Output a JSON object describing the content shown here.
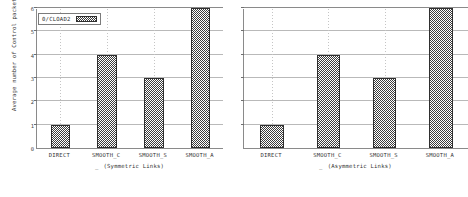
{
  "chart_data": {
    "type": "bar",
    "title": "",
    "xlabel": "",
    "ylabel": "Average number of Control packets per Handover [n]",
    "ylim": [
      0,
      6
    ],
    "yticks": [
      0,
      1,
      2,
      3,
      4,
      5,
      6
    ],
    "grid": true,
    "legend": {
      "position": "top-left",
      "entries": [
        {
          "label": "0/CLOAD2",
          "swatch": "hatched-dark-gray"
        }
      ]
    },
    "panels": [
      {
        "name": "symmetric",
        "subtitle": "(Symmetric Links)",
        "subtitle_prefix": "_",
        "categories": [
          "DIRECT",
          "SMOOTH_C",
          "SMOOTH_S",
          "SMOOTH_A"
        ],
        "values": [
          1,
          4,
          3,
          6
        ]
      },
      {
        "name": "asymmetric",
        "subtitle": "(Asymmetric Links)",
        "subtitle_prefix": "_",
        "categories": [
          "DIRECT",
          "SMOOTH_C",
          "SMOOTH_S",
          "SMOOTH_A"
        ],
        "values": [
          1,
          4,
          3,
          6
        ]
      }
    ],
    "series": [
      {
        "name": "0/CLOAD2",
        "values": [
          1,
          4,
          3,
          6,
          1,
          4,
          3,
          6
        ]
      }
    ],
    "colors": {
      "bar_fill": "#6e6e6e",
      "bar_edge": "#2f2f2f",
      "axis": "#8a8a8a",
      "grid": "#b9b9b9",
      "text": "#333333"
    }
  }
}
